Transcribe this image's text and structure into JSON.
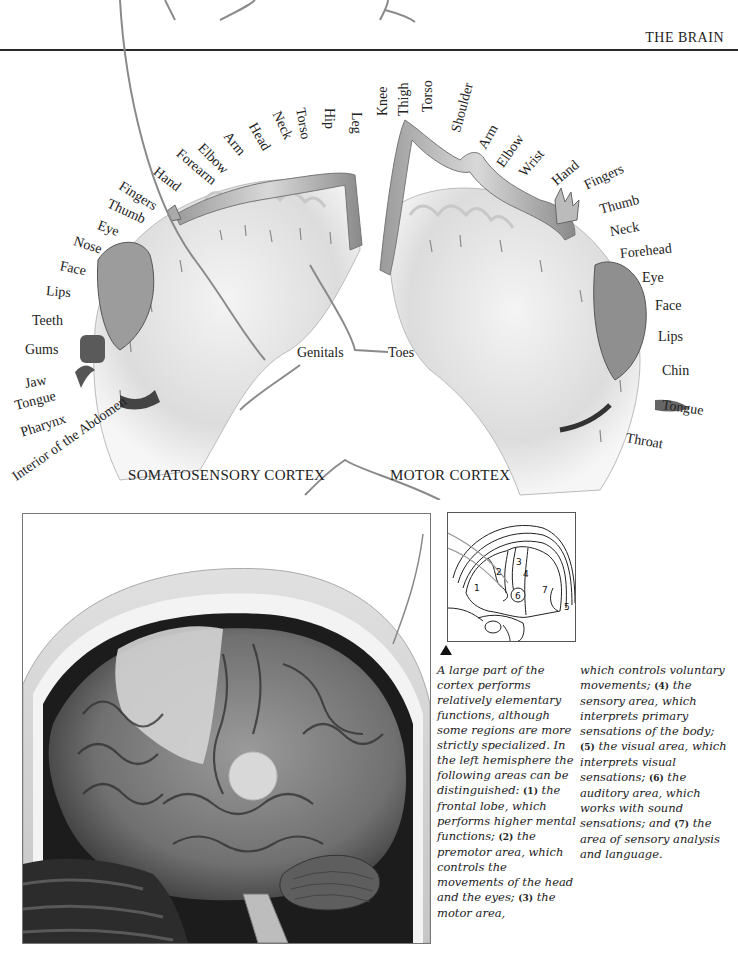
{
  "header": {
    "running_head": "THE BRAIN"
  },
  "homunculus": {
    "sensory": {
      "title": "SOMATOSENSORY CORTEX",
      "labels": [
        "Genitals",
        "Toes",
        "Leg",
        "Hip",
        "Torso",
        "Neck",
        "Head",
        "Arm",
        "Elbow",
        "Forearm",
        "Hand",
        "Fingers",
        "Thumb",
        "Eye",
        "Nose",
        "Face",
        "Lips",
        "Teeth",
        "Gums",
        "Jaw",
        "Tongue",
        "Pharynx",
        "Interior of the Abdomen"
      ]
    },
    "motor": {
      "title": "MOTOR CORTEX",
      "labels": [
        "Toes",
        "Knee",
        "Thigh",
        "Torso",
        "Shoulder",
        "Arm",
        "Elbow",
        "Wrist",
        "Hand",
        "Fingers",
        "Thumb",
        "Neck",
        "Forehead",
        "Eye",
        "Face",
        "Lips",
        "Chin",
        "Tongue",
        "Throat"
      ]
    }
  },
  "inset_diagram": {
    "areas": [
      "1",
      "2",
      "3",
      "4",
      "5",
      "6",
      "7"
    ]
  },
  "caption": {
    "col1": [
      {
        "t": "A large part of the cortex performs relatively elementary functions, although some regions are more strictly specialized. In the left hemisphere the following areas can be distinguished: "
      },
      {
        "n": "(1)"
      },
      {
        "t": " the frontal lobe, which performs higher mental functions; "
      },
      {
        "n": "(2)"
      },
      {
        "t": " the premotor area, which controls the movements of the head and the eyes; "
      },
      {
        "n": "(3)"
      },
      {
        "t": " the motor area,"
      }
    ],
    "col2": [
      {
        "t": "which controls voluntary movements; "
      },
      {
        "n": "(4)"
      },
      {
        "t": " the sensory area, which interprets primary sensations of the body; "
      },
      {
        "n": "(5)"
      },
      {
        "t": " the visual area, which interprets visual sensations; "
      },
      {
        "n": "(6)"
      },
      {
        "t": " the auditory area, which works with sound sensations; and "
      },
      {
        "n": "(7)"
      },
      {
        "t": " the area of sensory analysis and language."
      }
    ]
  },
  "colors": {
    "ink": "#222222",
    "rule": "#2a2a2a",
    "cortex_fill": "#d9d9d9",
    "brain_dark": "#4a4a4a"
  }
}
